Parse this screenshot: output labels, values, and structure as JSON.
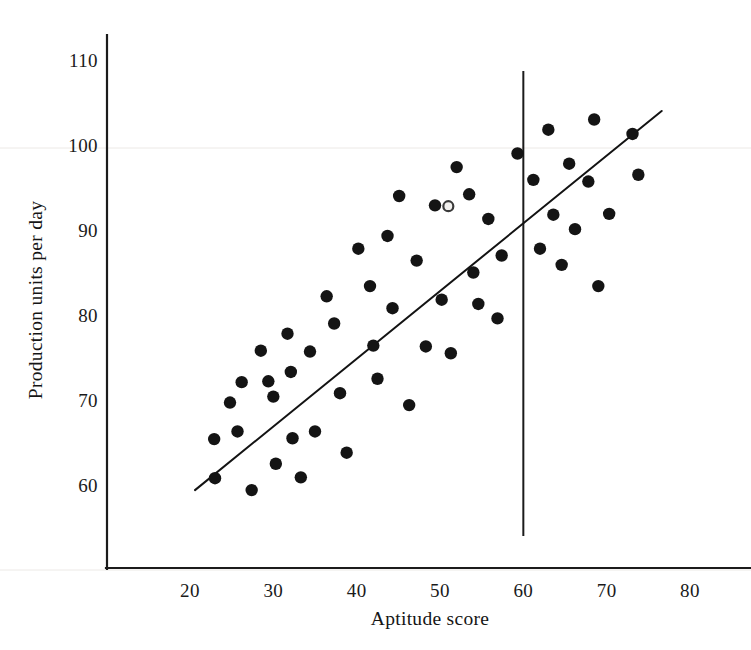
{
  "chart_data": {
    "type": "scatter",
    "title": "",
    "xlabel": "Aptitude score",
    "ylabel": "Production units per day",
    "xlim": [
      15,
      84
    ],
    "ylim": [
      54,
      113
    ],
    "xticks": [
      20,
      30,
      40,
      50,
      60,
      70,
      80
    ],
    "yticks": [
      60,
      70,
      80,
      90,
      100,
      110
    ],
    "grid": false,
    "legend": "none",
    "points": [
      {
        "x": 22.9,
        "y": 65.4
      },
      {
        "x": 23.0,
        "y": 60.8
      },
      {
        "x": 24.8,
        "y": 69.7
      },
      {
        "x": 25.7,
        "y": 66.3
      },
      {
        "x": 26.2,
        "y": 72.1
      },
      {
        "x": 27.4,
        "y": 59.4
      },
      {
        "x": 28.5,
        "y": 75.8
      },
      {
        "x": 29.4,
        "y": 72.2
      },
      {
        "x": 30.0,
        "y": 70.4
      },
      {
        "x": 30.3,
        "y": 62.5
      },
      {
        "x": 31.7,
        "y": 77.8
      },
      {
        "x": 32.1,
        "y": 73.3
      },
      {
        "x": 32.3,
        "y": 65.5
      },
      {
        "x": 33.3,
        "y": 60.9
      },
      {
        "x": 34.4,
        "y": 75.7
      },
      {
        "x": 35.0,
        "y": 66.3
      },
      {
        "x": 36.4,
        "y": 82.2
      },
      {
        "x": 37.3,
        "y": 79.0
      },
      {
        "x": 38.0,
        "y": 70.8
      },
      {
        "x": 38.8,
        "y": 63.8
      },
      {
        "x": 40.2,
        "y": 87.8
      },
      {
        "x": 41.6,
        "y": 83.4
      },
      {
        "x": 42.0,
        "y": 76.4
      },
      {
        "x": 42.5,
        "y": 72.5
      },
      {
        "x": 43.7,
        "y": 89.3
      },
      {
        "x": 44.3,
        "y": 80.8
      },
      {
        "x": 45.1,
        "y": 94.0
      },
      {
        "x": 46.3,
        "y": 69.4
      },
      {
        "x": 47.2,
        "y": 86.4
      },
      {
        "x": 48.3,
        "y": 76.3
      },
      {
        "x": 49.4,
        "y": 92.9
      },
      {
        "x": 50.2,
        "y": 81.8
      },
      {
        "x": 51.3,
        "y": 75.5
      },
      {
        "x": 52.0,
        "y": 97.4
      },
      {
        "x": 53.5,
        "y": 94.2
      },
      {
        "x": 54.0,
        "y": 85.0
      },
      {
        "x": 54.6,
        "y": 81.3
      },
      {
        "x": 55.8,
        "y": 91.3
      },
      {
        "x": 56.9,
        "y": 79.6
      },
      {
        "x": 57.4,
        "y": 87.0
      },
      {
        "x": 59.3,
        "y": 99.0
      },
      {
        "x": 61.2,
        "y": 95.9
      },
      {
        "x": 62.0,
        "y": 87.8
      },
      {
        "x": 63.0,
        "y": 101.8
      },
      {
        "x": 63.6,
        "y": 91.8
      },
      {
        "x": 64.6,
        "y": 85.9
      },
      {
        "x": 65.5,
        "y": 97.8
      },
      {
        "x": 66.2,
        "y": 90.1
      },
      {
        "x": 67.8,
        "y": 95.7
      },
      {
        "x": 68.5,
        "y": 103.0
      },
      {
        "x": 69.0,
        "y": 83.4
      },
      {
        "x": 70.3,
        "y": 91.9
      },
      {
        "x": 73.1,
        "y": 101.3
      },
      {
        "x": 73.8,
        "y": 96.5
      },
      {
        "x": 51.0,
        "y": 92.8,
        "style": "open"
      }
    ],
    "regression_line": {
      "name": "fitted-regression-line",
      "x_start": 20.6,
      "y_start": 59.4,
      "x_end": 76.6,
      "y_end": 104.0
    },
    "vertical_reference_line": {
      "name": "aptitude-cutoff-line",
      "x": 60,
      "y_bottom": 54,
      "y_top": 108.7
    }
  }
}
